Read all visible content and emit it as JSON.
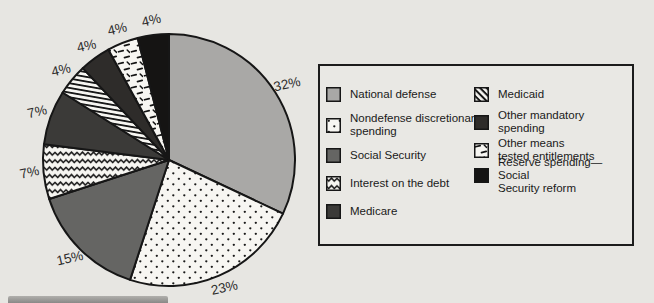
{
  "figure": {
    "background_color": "#e7e6e2",
    "outline_color": "#161616",
    "pattern_bg_color": "#f7f6f2",
    "label_suffix": "%"
  },
  "chart_data": {
    "type": "pie",
    "start_angle_deg_from_top": 0,
    "direction": "clockwise",
    "title": "",
    "categories": [
      "National defense",
      "Nondefense discretionary spending",
      "Social Security",
      "Interest on the debt",
      "Medicare",
      "Medicaid",
      "Other mandatory spending",
      "Other means tested entitlements",
      "Reserve spending—Social Security reform"
    ],
    "values": [
      32,
      23,
      15,
      7,
      7,
      4,
      4,
      4,
      4
    ],
    "slice_labels": [
      "32%",
      "23%",
      "15%",
      "7%",
      "7%",
      "4%",
      "4%",
      "4%",
      "4%"
    ],
    "slices": [
      {
        "label": "National defense",
        "value": 32,
        "fill": "#a9a8a6"
      },
      {
        "label": "Nondefense discretionary spending",
        "value": 23,
        "fill": "dots"
      },
      {
        "label": "Social Security",
        "value": 15,
        "fill": "#656563"
      },
      {
        "label": "Interest on the debt",
        "value": 7,
        "fill": "zigzag"
      },
      {
        "label": "Medicare",
        "value": 7,
        "fill": "#3b3a38"
      },
      {
        "label": "Medicaid",
        "value": 4,
        "fill": "stripes"
      },
      {
        "label": "Other mandatory spending",
        "value": 4,
        "fill": "#2e2c2a"
      },
      {
        "label": "Other means tested entitlements",
        "value": 4,
        "fill": "dashes"
      },
      {
        "label": "Reserve spending—Social Security reform",
        "value": 4,
        "fill": "#151413"
      }
    ],
    "legend_position": "right"
  },
  "legend": {
    "columns": [
      {
        "items": [
          {
            "label": "National defense",
            "fill": "#a9a8a6"
          },
          {
            "label": "Nondefense discretionary\nspending",
            "fill": "dots"
          },
          {
            "label": "Social Security",
            "fill": "#656563"
          },
          {
            "label": "Interest on the debt",
            "fill": "zigzag"
          },
          {
            "label": "Medicare",
            "fill": "#3b3a38"
          }
        ]
      },
      {
        "items": [
          {
            "label": "Medicaid",
            "fill": "stripes"
          },
          {
            "label": "Other mandatory\nspending",
            "fill": "#2e2c2a"
          },
          {
            "label": "Other means\ntested entitlements",
            "fill": "dashes"
          },
          {
            "label": "Reserve spending—Social\nSecurity reform",
            "fill": "#151413"
          }
        ]
      }
    ]
  }
}
